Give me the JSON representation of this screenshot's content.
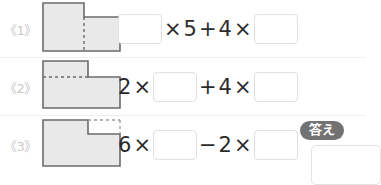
{
  "worksheet": {
    "rows": [
      {
        "label": "《1》",
        "figure": {
          "name": "l-shape-tall-left-vertical-dashed-divider",
          "fill": "#e9e9e9",
          "stroke": "#6b6b6b",
          "dash_color": "#6b6b6b"
        },
        "equation": {
          "tokens": [
            {
              "kind": "box",
              "value": ""
            },
            {
              "kind": "op",
              "value": "×"
            },
            {
              "kind": "num",
              "value": "5"
            },
            {
              "kind": "op",
              "value": "+"
            },
            {
              "kind": "num",
              "value": "4"
            },
            {
              "kind": "op",
              "value": "×"
            },
            {
              "kind": "box",
              "value": ""
            }
          ]
        }
      },
      {
        "label": "《2》",
        "figure": {
          "name": "l-shape-top-left-block-horizontal-dashed-divider",
          "fill": "#e9e9e9",
          "stroke": "#6b6b6b",
          "dash_color": "#6b6b6b"
        },
        "equation": {
          "tokens": [
            {
              "kind": "num",
              "value": "2"
            },
            {
              "kind": "op",
              "value": "×"
            },
            {
              "kind": "box",
              "value": ""
            },
            {
              "kind": "op",
              "value": "+"
            },
            {
              "kind": "num",
              "value": "4"
            },
            {
              "kind": "op",
              "value": "×"
            },
            {
              "kind": "box",
              "value": ""
            }
          ]
        }
      },
      {
        "label": "《3》",
        "figure": {
          "name": "rectangle-with-dashed-notch-top-right",
          "fill": "#e9e9e9",
          "stroke": "#6b6b6b",
          "dash_color": "#9a9a9a"
        },
        "equation": {
          "tokens": [
            {
              "kind": "num",
              "value": "6"
            },
            {
              "kind": "op",
              "value": "×"
            },
            {
              "kind": "box",
              "value": ""
            },
            {
              "kind": "op",
              "value": "−"
            },
            {
              "kind": "num",
              "value": "2"
            },
            {
              "kind": "op",
              "value": "×"
            },
            {
              "kind": "box",
              "value": ""
            }
          ]
        }
      }
    ],
    "answer": {
      "badge_label": "答え",
      "badge_color": "#727272",
      "badge_text_color": "#ffffff",
      "panel_value": ""
    }
  }
}
